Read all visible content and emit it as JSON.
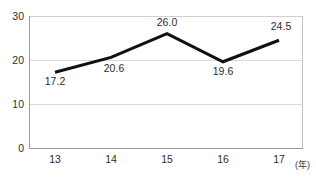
{
  "chart_data": {
    "type": "line",
    "title": "",
    "xlabel": "(年)",
    "ylabel": "",
    "categories": [
      "13",
      "14",
      "15",
      "16",
      "17"
    ],
    "values": [
      17.2,
      20.6,
      26.0,
      19.6,
      24.5
    ],
    "series": [
      {
        "name": "",
        "values": [
          17.2,
          20.6,
          26.0,
          19.6,
          24.5
        ]
      }
    ],
    "point_labels": [
      "17.2",
      "20.6",
      "26.0",
      "19.6",
      "24.5"
    ],
    "point_label_positions": [
      "below",
      "below",
      "above",
      "below",
      "above"
    ],
    "ylim": [
      0,
      30
    ],
    "y_ticks": [
      "0",
      "10",
      "20",
      "30"
    ],
    "y_tick_values": [
      0,
      10,
      20,
      30
    ],
    "x_ticks": [
      "13",
      "14",
      "15",
      "16",
      "17"
    ],
    "grid": true,
    "grid_axis": "y",
    "legend": false,
    "legend_position": "none",
    "line_color": "#111111",
    "grid_color": "#d9d9d9",
    "axis_color": "#8a8a8a",
    "background_color": "#ffffff"
  },
  "axis": {
    "y_labels": [
      "30",
      "20",
      "10",
      "0"
    ],
    "x_labels": [
      "13",
      "14",
      "15",
      "16",
      "17"
    ],
    "x_unit": "(年)"
  },
  "labels": {
    "p0": "17.2",
    "p1": "20.6",
    "p2": "26.0",
    "p3": "19.6",
    "p4": "24.5"
  },
  "title_remnant": "· ·· ·  ·· ·"
}
